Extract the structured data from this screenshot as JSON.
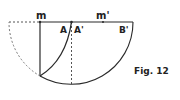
{
  "figure": {
    "caption": "Fig. 12",
    "labels": {
      "m": "m",
      "m_prime": "m'",
      "A": "A",
      "A_prime": "A'",
      "B_prime": "B'"
    },
    "colors": {
      "stroke": "#2a2a2a",
      "dashed": "#555555",
      "text": "#222222"
    }
  }
}
